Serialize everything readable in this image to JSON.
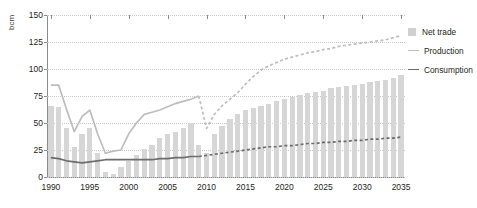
{
  "chart_data": {
    "type": "bar",
    "title": "",
    "subtitle": "",
    "xlabel": "",
    "ylabel": "bcm",
    "xlim": [
      1990,
      2035
    ],
    "ylim": [
      0,
      150
    ],
    "yticks": [
      0,
      25,
      50,
      75,
      100,
      125,
      150
    ],
    "xticks": [
      1990,
      1995,
      2000,
      2005,
      2010,
      2015,
      2020,
      2025,
      2030,
      2035
    ],
    "grid": true,
    "legend_position": "right",
    "forecast_start": 2009,
    "x": [
      1990,
      1991,
      1992,
      1993,
      1994,
      1995,
      1996,
      1997,
      1998,
      1999,
      2000,
      2001,
      2002,
      2003,
      2004,
      2005,
      2006,
      2007,
      2008,
      2009,
      2010,
      2011,
      2012,
      2013,
      2014,
      2015,
      2016,
      2017,
      2018,
      2019,
      2020,
      2021,
      2022,
      2023,
      2024,
      2025,
      2026,
      2027,
      2028,
      2029,
      2030,
      2031,
      2032,
      2033,
      2034,
      2035
    ],
    "series": [
      {
        "name": "Net trade",
        "type": "bar",
        "color": "#d6d6d6",
        "values": [
          66,
          65,
          45,
          28,
          40,
          45,
          22,
          5,
          3,
          9,
          15,
          20,
          26,
          30,
          36,
          40,
          42,
          45,
          50,
          30,
          22,
          40,
          47,
          54,
          58,
          62,
          64,
          66,
          68,
          70,
          72,
          74,
          76,
          78,
          79,
          80,
          82,
          83,
          84,
          85,
          86,
          88,
          89,
          90,
          92,
          94
        ]
      },
      {
        "name": "Production",
        "type": "line",
        "color": "#bdbdbd",
        "values": [
          85,
          85,
          63,
          42,
          56,
          62,
          40,
          22,
          24,
          25,
          40,
          50,
          58,
          60,
          62,
          65,
          68,
          70,
          72,
          75,
          45,
          58,
          66,
          72,
          78,
          86,
          93,
          99,
          103,
          106,
          109,
          111,
          113,
          115,
          116,
          118,
          119,
          121,
          122,
          123,
          124,
          125,
          126,
          127,
          129,
          131
        ]
      },
      {
        "name": "Consumption",
        "type": "line",
        "color": "#6d6d6d",
        "values": [
          18,
          17,
          15,
          14,
          13,
          14,
          15,
          16,
          16,
          16,
          16,
          16,
          16,
          16,
          17,
          17,
          18,
          18,
          19,
          19,
          20,
          21,
          22,
          23,
          24,
          25,
          26,
          27,
          28,
          28,
          29,
          29,
          30,
          31,
          31,
          32,
          32,
          33,
          33,
          34,
          34,
          35,
          35,
          36,
          36,
          37
        ]
      }
    ]
  },
  "legend": {
    "items": [
      {
        "label": "Net trade",
        "marker": "square",
        "color": "#d0d0d0"
      },
      {
        "label": "Production",
        "marker": "line",
        "color": "#bdbdbd"
      },
      {
        "label": "Consumption",
        "marker": "line",
        "color": "#6d6d6d"
      }
    ]
  }
}
